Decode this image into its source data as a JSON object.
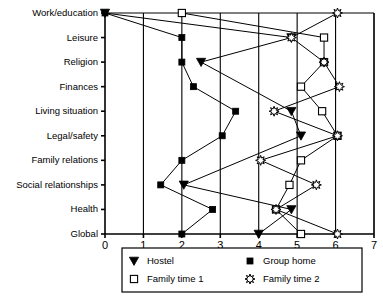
{
  "chart_data": {
    "type": "line",
    "title": "",
    "subtitle": "",
    "xlabel": "",
    "ylabel": "",
    "orientation": "horizontal",
    "xlim": [
      0,
      7
    ],
    "xticks": [
      "0",
      "1",
      "2",
      "3",
      "4",
      "5",
      "6",
      "7"
    ],
    "grid": "vertical gridlines at each integer tick",
    "legend_position": "bottom-center, boxed, 2 columns x 2 rows",
    "categories": [
      "Work/education",
      "Leisure",
      "Religion",
      "Finances",
      "Living situation",
      "Legal/safety",
      "Family relations",
      "Social relationships",
      "Health",
      "Global"
    ],
    "series": [
      {
        "name": "Hostel",
        "marker": "filled-down-triangle",
        "color": "#000000",
        "values": [
          0.0,
          4.85,
          2.5,
          null,
          4.85,
          5.1,
          null,
          2.05,
          4.85,
          4.0
        ]
      },
      {
        "name": "Group home",
        "marker": "filled-square",
        "color": "#000000",
        "values": [
          0.0,
          2.0,
          2.0,
          2.3,
          3.4,
          3.05,
          2.0,
          1.45,
          2.8,
          2.0
        ]
      },
      {
        "name": "Family time 1",
        "marker": "open-square",
        "color": "#000000",
        "values": [
          2.0,
          5.7,
          5.7,
          5.1,
          5.65,
          6.05,
          5.1,
          4.8,
          4.45,
          5.1
        ]
      },
      {
        "name": "Family time  2",
        "marker": "open-starburst",
        "color": "#000000",
        "values": [
          6.05,
          4.85,
          5.7,
          6.1,
          4.4,
          6.05,
          4.05,
          5.5,
          4.45,
          6.05
        ]
      }
    ]
  },
  "legend": {
    "entries": [
      {
        "label": "Hostel",
        "marker": "filled-down-triangle"
      },
      {
        "label": "Group home",
        "marker": "filled-square"
      },
      {
        "label": "Family time 1",
        "marker": "open-square"
      },
      {
        "label": "Family time  2",
        "marker": "open-starburst"
      }
    ]
  }
}
